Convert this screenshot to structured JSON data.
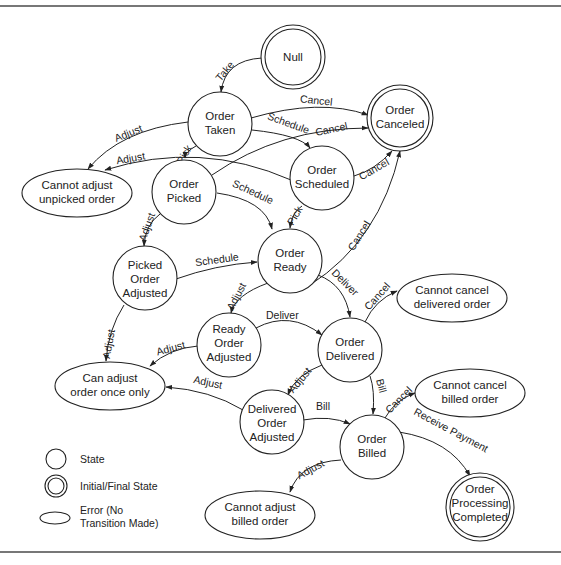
{
  "diagram": {
    "type": "state-transition",
    "nodes": [
      {
        "id": "null",
        "kind": "initial-final",
        "lines": [
          "Null"
        ]
      },
      {
        "id": "order-taken",
        "kind": "state",
        "lines": [
          "Order",
          "Taken"
        ]
      },
      {
        "id": "order-canceled",
        "kind": "initial-final",
        "lines": [
          "Order",
          "Canceled"
        ]
      },
      {
        "id": "cannot-adjust-unpicked",
        "kind": "error",
        "lines": [
          "Cannot adjust",
          "unpicked order"
        ]
      },
      {
        "id": "order-picked",
        "kind": "state",
        "lines": [
          "Order",
          "Picked"
        ]
      },
      {
        "id": "order-scheduled",
        "kind": "state",
        "lines": [
          "Order",
          "Scheduled"
        ]
      },
      {
        "id": "order-ready",
        "kind": "state",
        "lines": [
          "Order",
          "Ready"
        ]
      },
      {
        "id": "picked-order-adjusted",
        "kind": "state",
        "lines": [
          "Picked",
          "Order",
          "Adjusted"
        ]
      },
      {
        "id": "ready-order-adjusted",
        "kind": "state",
        "lines": [
          "Ready",
          "Order",
          "Adjusted"
        ]
      },
      {
        "id": "order-delivered",
        "kind": "state",
        "lines": [
          "Order",
          "Delivered"
        ]
      },
      {
        "id": "cannot-cancel-delivered",
        "kind": "error",
        "lines": [
          "Cannot cancel",
          "delivered order"
        ]
      },
      {
        "id": "can-adjust-once",
        "kind": "error",
        "lines": [
          "Can adjust",
          "order once only"
        ]
      },
      {
        "id": "delivered-order-adjusted",
        "kind": "state",
        "lines": [
          "Delivered",
          "Order",
          "Adjusted"
        ]
      },
      {
        "id": "cannot-cancel-billed",
        "kind": "error",
        "lines": [
          "Cannot cancel",
          "billed order"
        ]
      },
      {
        "id": "order-billed",
        "kind": "state",
        "lines": [
          "Order",
          "Billed"
        ]
      },
      {
        "id": "cannot-adjust-billed",
        "kind": "error",
        "lines": [
          "Cannot adjust",
          "billed order"
        ]
      },
      {
        "id": "order-processing-completed",
        "kind": "initial-final",
        "lines": [
          "Order",
          "Processing",
          "Completed"
        ]
      }
    ],
    "edges": [
      {
        "from": "null",
        "to": "order-taken",
        "label": "Take"
      },
      {
        "from": "order-taken",
        "to": "order-canceled",
        "label": "Cancel"
      },
      {
        "from": "order-taken",
        "to": "order-scheduled",
        "label": "Schedule"
      },
      {
        "from": "order-taken",
        "to": "cannot-adjust-unpicked",
        "label": "Adjust"
      },
      {
        "from": "order-taken",
        "to": "order-picked",
        "label": "Pick"
      },
      {
        "from": "order-scheduled",
        "to": "cannot-adjust-unpicked",
        "label": "Adjust"
      },
      {
        "from": "order-picked",
        "to": "order-canceled",
        "label": "Cancel"
      },
      {
        "from": "order-scheduled",
        "to": "order-canceled",
        "label": "Cancel"
      },
      {
        "from": "order-picked",
        "to": "order-ready",
        "label": "Schedule"
      },
      {
        "from": "order-scheduled",
        "to": "order-ready",
        "label": "Pick"
      },
      {
        "from": "order-ready",
        "to": "order-canceled",
        "label": "Cancel"
      },
      {
        "from": "order-picked",
        "to": "picked-order-adjusted",
        "label": "Adjust"
      },
      {
        "from": "picked-order-adjusted",
        "to": "order-ready",
        "label": "Schedule"
      },
      {
        "from": "order-ready",
        "to": "ready-order-adjusted",
        "label": "Adjust"
      },
      {
        "from": "order-ready",
        "to": "order-delivered",
        "label": "Deliver"
      },
      {
        "from": "picked-order-adjusted",
        "to": "can-adjust-once",
        "label": "Adjust"
      },
      {
        "from": "ready-order-adjusted",
        "to": "order-delivered",
        "label": "Deliver"
      },
      {
        "from": "ready-order-adjusted",
        "to": "can-adjust-once",
        "label": "Adjust"
      },
      {
        "from": "order-delivered",
        "to": "cannot-cancel-delivered",
        "label": "Cancel"
      },
      {
        "from": "order-delivered",
        "to": "delivered-order-adjusted",
        "label": "Adjust"
      },
      {
        "from": "order-delivered",
        "to": "order-billed",
        "label": "Bill"
      },
      {
        "from": "delivered-order-adjusted",
        "to": "can-adjust-once",
        "label": "Adjust"
      },
      {
        "from": "delivered-order-adjusted",
        "to": "order-billed",
        "label": "Bill"
      },
      {
        "from": "order-billed",
        "to": "cannot-cancel-billed",
        "label": "Cancel"
      },
      {
        "from": "order-billed",
        "to": "order-processing-completed",
        "label": "Receive Payment"
      },
      {
        "from": "order-billed",
        "to": "cannot-adjust-billed",
        "label": "Adjust"
      }
    ],
    "legend": [
      {
        "shape": "circle",
        "label": "State"
      },
      {
        "shape": "double-circle",
        "label": "Initial/Final State"
      },
      {
        "shape": "ellipse",
        "label_lines": [
          "Error (No",
          "Transition Made)"
        ]
      }
    ]
  },
  "labels": {
    "null": [
      "Null"
    ],
    "taken": [
      "Order",
      "Taken"
    ],
    "canceled": [
      "Order",
      "Canceled"
    ],
    "unpicked": [
      "Cannot adjust",
      "unpicked order"
    ],
    "picked": [
      "Order",
      "Picked"
    ],
    "scheduled": [
      "Order",
      "Scheduled"
    ],
    "ready": [
      "Order",
      "Ready"
    ],
    "pickedAdj": [
      "Picked",
      "Order",
      "Adjusted"
    ],
    "readyAdj": [
      "Ready",
      "Order",
      "Adjusted"
    ],
    "delivered": [
      "Order",
      "Delivered"
    ],
    "cantCancelDel": [
      "Cannot cancel",
      "delivered order"
    ],
    "onceOnly": [
      "Can adjust",
      "order once only"
    ],
    "delAdj": [
      "Delivered",
      "Order",
      "Adjusted"
    ],
    "cantCancelBilled": [
      "Cannot cancel",
      "billed order"
    ],
    "billed": [
      "Order",
      "Billed"
    ],
    "cantAdjBilled": [
      "Cannot adjust",
      "billed order"
    ],
    "completed": [
      "Order",
      "Processing",
      "Completed"
    ]
  },
  "edge_labels": {
    "take": "Take",
    "cancel": "Cancel",
    "schedule": "Schedule",
    "adjust": "Adjust",
    "pick": "Pick",
    "deliver": "Deliver",
    "bill": "Bill",
    "receive_payment": "Receive Payment"
  },
  "legend": {
    "state": "State",
    "initial_final": "Initial/Final State",
    "error_line1": "Error (No",
    "error_line2": "Transition Made)"
  }
}
